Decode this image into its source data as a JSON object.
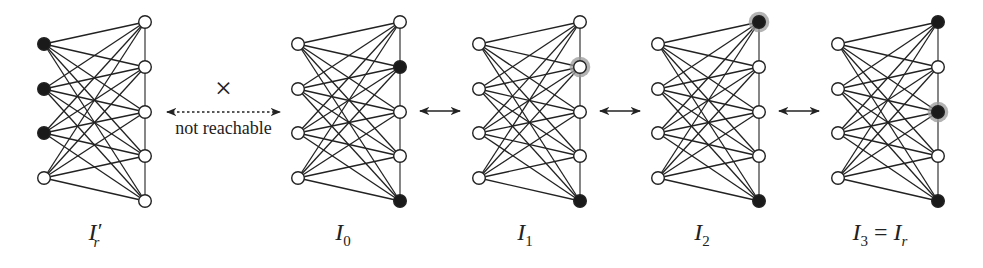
{
  "figure": {
    "left_y": [
      44,
      89,
      133,
      178
    ],
    "right_y": [
      22,
      67,
      112,
      156,
      201
    ],
    "colors": {
      "filled": "#1a1a1a",
      "empty": "#ffffff",
      "halo": "#9a9a9a",
      "stroke": "#222222"
    },
    "graphs": [
      {
        "id": "Ir-prime",
        "label_main": "I",
        "label_prime": "′",
        "label_sub": "r",
        "label_x": 95,
        "left_x": 44,
        "right_x": 145,
        "left_filled": [
          true,
          true,
          true,
          false
        ],
        "right_filled": [
          false,
          false,
          false,
          false,
          false
        ],
        "right_halo": [
          false,
          false,
          false,
          false,
          false
        ]
      },
      {
        "id": "I0",
        "label_main": "I",
        "label_sub": "0",
        "label_x": 343,
        "left_x": 298,
        "right_x": 400,
        "left_filled": [
          false,
          false,
          false,
          false
        ],
        "right_filled": [
          false,
          true,
          false,
          false,
          true
        ],
        "right_halo": [
          false,
          false,
          false,
          false,
          false
        ]
      },
      {
        "id": "I1",
        "label_main": "I",
        "label_sub": "1",
        "label_x": 525,
        "left_x": 479,
        "right_x": 580,
        "left_filled": [
          false,
          false,
          false,
          false
        ],
        "right_filled": [
          false,
          false,
          false,
          false,
          true
        ],
        "right_halo": [
          false,
          true,
          false,
          false,
          false
        ]
      },
      {
        "id": "I2",
        "label_main": "I",
        "label_sub": "2",
        "label_x": 702,
        "left_x": 658,
        "right_x": 759,
        "left_filled": [
          false,
          false,
          false,
          false
        ],
        "right_filled": [
          true,
          false,
          false,
          false,
          true
        ],
        "right_halo": [
          true,
          false,
          false,
          false,
          false
        ]
      },
      {
        "id": "I3",
        "label_main": "I",
        "label_sub": "3",
        "label_eq": " = ",
        "label_main2": "I",
        "label_sub2": "r",
        "label_x": 880,
        "left_x": 838,
        "right_x": 938,
        "left_filled": [
          false,
          false,
          false,
          false
        ],
        "right_filled": [
          true,
          false,
          true,
          false,
          true
        ],
        "right_halo": [
          false,
          false,
          true,
          false,
          false
        ]
      }
    ],
    "arrows": [
      {
        "x1": 164,
        "x2": 283,
        "y": 112,
        "style": "dotted",
        "label": "not reachable",
        "mark": "×"
      },
      {
        "x1": 417,
        "x2": 463,
        "y": 111,
        "style": "solid"
      },
      {
        "x1": 597,
        "x2": 643,
        "y": 111,
        "style": "solid"
      },
      {
        "x1": 776,
        "x2": 822,
        "y": 111,
        "style": "solid"
      }
    ]
  }
}
